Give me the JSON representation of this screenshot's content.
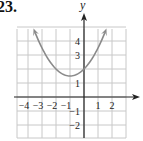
{
  "problem_number": "23.",
  "chart_data": {
    "type": "line",
    "title": "",
    "xlabel": "",
    "ylabel": "y",
    "xlim": [
      -5,
      3
    ],
    "ylim": [
      -3,
      5
    ],
    "grid": true,
    "x_tick_labels": [
      "-4",
      "-3",
      "-2",
      "-1",
      "1",
      "2"
    ],
    "x_ticks": [
      -4,
      -3,
      -2,
      -1,
      1,
      2
    ],
    "y_tick_labels": [
      "4",
      "3",
      "1",
      "-1",
      "-2"
    ],
    "y_ticks": [
      4,
      3,
      1,
      -1,
      -2
    ],
    "series": [
      {
        "name": "parabola",
        "equation": "y = 0.5(x + 1)^2 + 1.5",
        "vertex": [
          -1,
          1.5
        ],
        "y_intercept": 2,
        "x_range": [
          -3.5,
          1.5
        ],
        "arrows_at_both_ends": true,
        "color": "#8a8a8a",
        "x": [
          -3.5,
          -3,
          -2.5,
          -2,
          -1.5,
          -1,
          -0.5,
          0,
          0.5,
          1,
          1.5
        ],
        "values": [
          4.625,
          3.5,
          2.625,
          2.0,
          1.625,
          1.5,
          1.625,
          2.0,
          2.625,
          3.5,
          4.625
        ]
      }
    ],
    "colors": {
      "grid": "#c8c8c8",
      "axes": "#222222",
      "curve": "#8a8a8a"
    }
  }
}
